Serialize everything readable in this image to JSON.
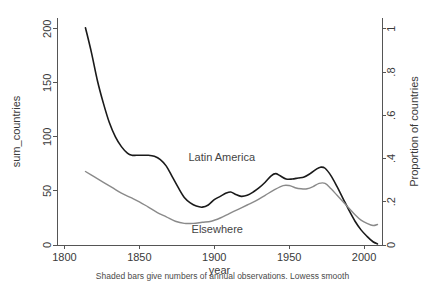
{
  "chart_data": {
    "type": "line",
    "title": "",
    "subtitle": "",
    "xlabel": "year",
    "ylabel": "sum_countries",
    "y2label": "Proportion of countries",
    "caption": "Shaded bars give numbers of annual observations. Lowess smooth",
    "grid": false,
    "legend_position": "inline-annotation",
    "xlim": [
      1795,
      2012
    ],
    "ylim": [
      0,
      210
    ],
    "y2lim": [
      0,
      1.05
    ],
    "xticks": [
      1800,
      1850,
      1900,
      1950,
      2000
    ],
    "xtick_labels": [
      "1800",
      "1850",
      "1900",
      "1950",
      "2000"
    ],
    "yticks": [
      0,
      50,
      100,
      150,
      200
    ],
    "ytick_labels": [
      "0",
      "50",
      "100",
      "150",
      "200"
    ],
    "y2ticks": [
      0,
      0.2,
      0.4,
      0.6,
      0.8,
      1
    ],
    "y2tick_labels": [
      "0",
      ".2",
      ".4",
      ".6",
      ".8",
      "1"
    ],
    "y_to_y2_ratio": 200,
    "annotations": [
      {
        "text": "Latin America",
        "x": 1905,
        "y": 78,
        "color": "#444444"
      },
      {
        "text": "Elsewhere",
        "x": 1902,
        "y": 11,
        "color": "#444444"
      }
    ],
    "series": [
      {
        "name": "Latin America",
        "color": "#1a1a1a",
        "width": 1.6,
        "x": [
          1814,
          1818,
          1822,
          1826,
          1830,
          1834,
          1838,
          1842,
          1845,
          1848,
          1852,
          1856,
          1860,
          1864,
          1868,
          1872,
          1876,
          1880,
          1884,
          1888,
          1892,
          1896,
          1900,
          1904,
          1908,
          1911,
          1914,
          1918,
          1922,
          1926,
          1930,
          1934,
          1938,
          1941,
          1944,
          1948,
          1952,
          1956,
          1960,
          1964,
          1968,
          1971,
          1974,
          1978,
          1982,
          1986,
          1990,
          1994,
          1998,
          2002,
          2006,
          2009
        ],
        "values": [
          201,
          178,
          152,
          131,
          113,
          100,
          91,
          85,
          83,
          83,
          83,
          83,
          82,
          79,
          73,
          63,
          53,
          44,
          39,
          36,
          35,
          37,
          42,
          45,
          48,
          49,
          47,
          45,
          46,
          49,
          53,
          58,
          64,
          66,
          64,
          61,
          61,
          62,
          63,
          66,
          70,
          72,
          71,
          64,
          54,
          43,
          32,
          22,
          14,
          8,
          3,
          1
        ]
      },
      {
        "name": "Elsewhere",
        "color": "#8a8a8a",
        "width": 1.4,
        "x": [
          1814,
          1820,
          1826,
          1832,
          1838,
          1844,
          1850,
          1856,
          1862,
          1868,
          1874,
          1880,
          1886,
          1892,
          1898,
          1904,
          1910,
          1916,
          1922,
          1928,
          1934,
          1940,
          1946,
          1950,
          1954,
          1958,
          1962,
          1966,
          1970,
          1974,
          1978,
          1982,
          1986,
          1990,
          1994,
          1998,
          2002,
          2006,
          2009
        ],
        "values": [
          68,
          63,
          58,
          53,
          48,
          44,
          40,
          35,
          30,
          26,
          22,
          20,
          20,
          21,
          22,
          25,
          29,
          33,
          37,
          41,
          46,
          51,
          55,
          55,
          53,
          52,
          52,
          54,
          57,
          57,
          52,
          46,
          40,
          34,
          28,
          23,
          20,
          18,
          19
        ]
      }
    ]
  },
  "figure": {
    "background_color": "#ffffff",
    "axis_color": "#555555",
    "text_color": "#3a3a3a"
  }
}
